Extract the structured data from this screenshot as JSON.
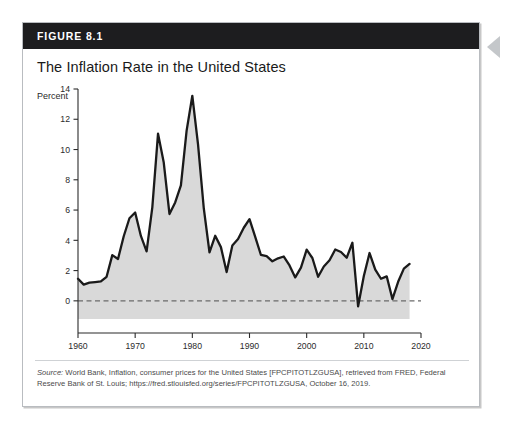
{
  "figure": {
    "number_label": "FIGURE 8.1",
    "title": "The Inflation Rate in the United States",
    "source_prefix": "Source:",
    "source_text": " World Bank, Inflation, consumer prices for the United States [FPCPITOTLZGUSA], retrieved from FRED, Federal Reserve Bank of St. Louis; https://fred.stlouisfed.org/series/FPCPITOTLZGUSA, October 16, 2019."
  },
  "colors": {
    "header_bg": "#1d1d1f",
    "header_text": "#ffffff",
    "line": "#1a1a1a",
    "area_fill": "#d9d9d9",
    "zero_line": "#6b6b6b",
    "card_border": "#b9bcc0",
    "side_arrow": "#c4c7ca"
  },
  "chart_data": {
    "type": "area",
    "title": "The Inflation Rate in the United States",
    "xlabel": "Year",
    "ylabel": "Percent",
    "xlim": [
      1960,
      2020
    ],
    "ylim": [
      -1.2,
      14
    ],
    "xticks": [
      1960,
      1970,
      1980,
      1990,
      2000,
      2010,
      2020
    ],
    "yticks": [
      0,
      2,
      4,
      6,
      8,
      10,
      12,
      14
    ],
    "grid": false,
    "legend": "none",
    "zero_reference_line": 0,
    "series_name": "Inflation rate (annual %)",
    "x": [
      1960,
      1961,
      1962,
      1963,
      1964,
      1965,
      1966,
      1967,
      1968,
      1969,
      1970,
      1971,
      1972,
      1973,
      1974,
      1975,
      1976,
      1977,
      1978,
      1979,
      1980,
      1981,
      1982,
      1983,
      1984,
      1985,
      1986,
      1987,
      1988,
      1989,
      1990,
      1991,
      1992,
      1993,
      1994,
      1995,
      1996,
      1997,
      1998,
      1999,
      2000,
      2001,
      2002,
      2003,
      2004,
      2005,
      2006,
      2007,
      2008,
      2009,
      2010,
      2011,
      2012,
      2013,
      2014,
      2015,
      2016,
      2017,
      2018
    ],
    "values": [
      1.46,
      1.07,
      1.2,
      1.24,
      1.28,
      1.59,
      3.02,
      2.77,
      4.27,
      5.46,
      5.84,
      4.29,
      3.27,
      6.18,
      11.05,
      9.14,
      5.74,
      6.5,
      7.63,
      11.25,
      13.55,
      10.33,
      6.13,
      3.21,
      4.3,
      3.55,
      1.9,
      3.66,
      4.08,
      4.83,
      5.4,
      4.23,
      3.03,
      2.95,
      2.61,
      2.81,
      2.93,
      2.34,
      1.55,
      2.19,
      3.38,
      2.83,
      1.59,
      2.27,
      2.68,
      3.39,
      3.23,
      2.85,
      3.84,
      -0.36,
      1.64,
      3.16,
      2.07,
      1.46,
      1.62,
      0.12,
      1.26,
      2.13,
      2.44
    ]
  }
}
